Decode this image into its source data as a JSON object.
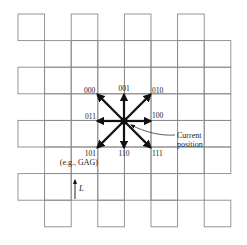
{
  "diagram": {
    "grid": {
      "origin_x": 18,
      "origin_y": 14,
      "cell": 26.6,
      "stroke": "#8a8a8a",
      "cells": [
        [
          0,
          0
        ],
        [
          0,
          2
        ],
        [
          0,
          4
        ],
        [
          0,
          6
        ],
        [
          1,
          1
        ],
        [
          1,
          2
        ],
        [
          1,
          3
        ],
        [
          1,
          4
        ],
        [
          1,
          5
        ],
        [
          1,
          6
        ],
        [
          1,
          7
        ],
        [
          2,
          0
        ],
        [
          2,
          1
        ],
        [
          2,
          2
        ],
        [
          2,
          3
        ],
        [
          2,
          4
        ],
        [
          2,
          5
        ],
        [
          2,
          6
        ],
        [
          2,
          7
        ],
        [
          3,
          1
        ],
        [
          3,
          2
        ],
        [
          3,
          3
        ],
        [
          3,
          4
        ],
        [
          3,
          5
        ],
        [
          3,
          6
        ],
        [
          3,
          7
        ],
        [
          4,
          0
        ],
        [
          4,
          1
        ],
        [
          4,
          2
        ],
        [
          4,
          3
        ],
        [
          4,
          4
        ],
        [
          4,
          5
        ],
        [
          4,
          6
        ],
        [
          4,
          7
        ],
        [
          5,
          1
        ],
        [
          5,
          2
        ],
        [
          5,
          3
        ],
        [
          5,
          4
        ],
        [
          5,
          5
        ],
        [
          5,
          6
        ],
        [
          5,
          7
        ],
        [
          6,
          0
        ],
        [
          6,
          1
        ],
        [
          6,
          2
        ],
        [
          6,
          3
        ],
        [
          6,
          4
        ],
        [
          6,
          5
        ],
        [
          6,
          6
        ],
        [
          7,
          1
        ],
        [
          7,
          3
        ],
        [
          7,
          5
        ],
        [
          7,
          7
        ]
      ]
    },
    "center": {
      "x": 124,
      "y": 121
    },
    "arrow_color": "#111111",
    "moves": [
      {
        "code": "000",
        "dx": -1,
        "dy": -1,
        "label_x": 84,
        "label_y": 93,
        "anchor": "start"
      },
      {
        "code": "001",
        "dx": 0,
        "dy": -1,
        "label_x": 124,
        "label_y": 91,
        "anchor": "middle"
      },
      {
        "code": "010",
        "dx": 1,
        "dy": -1,
        "label_x": 152,
        "label_y": 93,
        "anchor": "start"
      },
      {
        "code": "011",
        "dx": -1,
        "dy": 0,
        "label_x": 96,
        "label_y": 119,
        "anchor": "end"
      },
      {
        "code": "100",
        "dx": 1,
        "dy": 0,
        "label_x": 152,
        "label_y": 118,
        "anchor": "start"
      },
      {
        "code": "101",
        "dx": -1,
        "dy": 1,
        "label_x": 96,
        "label_y": 156,
        "anchor": "end"
      },
      {
        "code": "110",
        "dx": 0,
        "dy": 1,
        "label_x": 124,
        "label_y": 156,
        "anchor": "middle"
      },
      {
        "code": "111",
        "dx": 1,
        "dy": 1,
        "label_x": 152,
        "label_y": 156,
        "anchor": "start"
      }
    ],
    "example_label": "(e.g., GAG)",
    "current_position_label": [
      "Current",
      "position"
    ],
    "length_label": "L"
  }
}
